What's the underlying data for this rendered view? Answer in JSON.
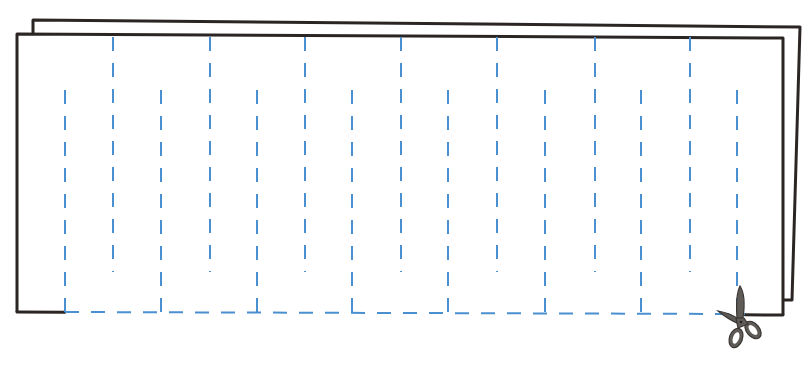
{
  "diagram": {
    "kind": "folded paper cutting pattern",
    "colors": {
      "background": "#ffffff",
      "paper_outline": "#2b2624",
      "cut_line": "#4a90d0",
      "scissors_fill": "#5f5b57",
      "scissors_outline": "#3a3633"
    },
    "back_sheet": {
      "points": [
        [
          33,
          35
        ],
        [
          33,
          20
        ],
        [
          800,
          27
        ],
        [
          792,
          300
        ],
        [
          783,
          300
        ]
      ]
    },
    "front_sheet": {
      "top_left": [
        17,
        34
      ],
      "top_right": [
        783,
        38
      ],
      "bottom_left": [
        17,
        312
      ],
      "bottom_right": [
        783,
        315
      ],
      "solid_bottom_segments": [
        [
          17,
          65
        ],
        [
          745,
          783
        ]
      ]
    },
    "cut_lines_from_bottom": {
      "x": [
        65,
        161,
        257,
        352,
        448,
        545,
        641,
        737
      ],
      "y_start": 78,
      "y_end": 312
    },
    "cut_lines_from_top": {
      "x": [
        113,
        210,
        305,
        401,
        497,
        595,
        690
      ],
      "y_start": 37,
      "y_end": 272
    },
    "bottom_cut_line": {
      "x_start": 65,
      "x_end": 745,
      "y": 312
    },
    "dash_pattern": "14 12",
    "scissors": {
      "x": 740,
      "y": 318,
      "label": "scissors-icon"
    }
  }
}
